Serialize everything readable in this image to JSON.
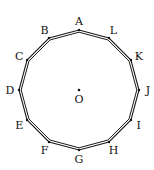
{
  "diagram": {
    "type": "regular-dodecagon",
    "center": {
      "label": "O",
      "x": 79,
      "y": 90
    },
    "radius": 60,
    "vertices": [
      {
        "label": "A",
        "angle_deg": 90
      },
      {
        "label": "B",
        "angle_deg": 120
      },
      {
        "label": "C",
        "angle_deg": 150
      },
      {
        "label": "D",
        "angle_deg": 180
      },
      {
        "label": "E",
        "angle_deg": 210
      },
      {
        "label": "F",
        "angle_deg": 240
      },
      {
        "label": "G",
        "angle_deg": 270
      },
      {
        "label": "H",
        "angle_deg": 300
      },
      {
        "label": "I",
        "angle_deg": 330
      },
      {
        "label": "J",
        "angle_deg": 0
      },
      {
        "label": "K",
        "angle_deg": 30
      },
      {
        "label": "L",
        "angle_deg": 60
      }
    ],
    "stroke_color": "#1a1a1a"
  }
}
